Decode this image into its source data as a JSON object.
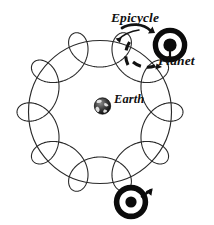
{
  "figure": {
    "name": "ptolemaic-epicycle-diagram",
    "background_color": "#ffffff",
    "ink_color": "#1a1a1a",
    "width": 214,
    "height": 225
  },
  "labels": {
    "epicycle": "Epicycle",
    "planet": "Planet",
    "earth": "Earth"
  },
  "icons": {
    "earth": "earth-globe-icon",
    "planet": "planet-symbol-icon",
    "mars": "mars-symbol-icon",
    "epicycle_pointer": "curved-arrow-icon",
    "epicycle_ring": "dashed-arc-arrow-icon"
  },
  "chart_data": {
    "type": "line",
    "title": "",
    "xlabel": "",
    "ylabel": "",
    "geometry": {
      "center": [
        100,
        112
      ],
      "deferent_radius": 72,
      "epicycle_radius": 16,
      "loop_count": 9,
      "curve_type": "epitrochoid",
      "R": 72,
      "r": 8,
      "d": 19
    },
    "markers": [
      {
        "name": "Earth",
        "x": 103,
        "y": 106,
        "symbol": "globe"
      },
      {
        "name": "Planet",
        "x": 170,
        "y": 45,
        "symbol": "ringed-disc"
      },
      {
        "name": "Mars",
        "x": 131,
        "y": 202,
        "symbol": "mars"
      }
    ],
    "annotations": [
      {
        "text": "Epicycle",
        "x": 111,
        "y": 11
      },
      {
        "text": "Planet",
        "x": 158,
        "y": 54
      },
      {
        "text": "Earth",
        "x": 114,
        "y": 93
      }
    ],
    "grid": false,
    "legend": "none"
  }
}
